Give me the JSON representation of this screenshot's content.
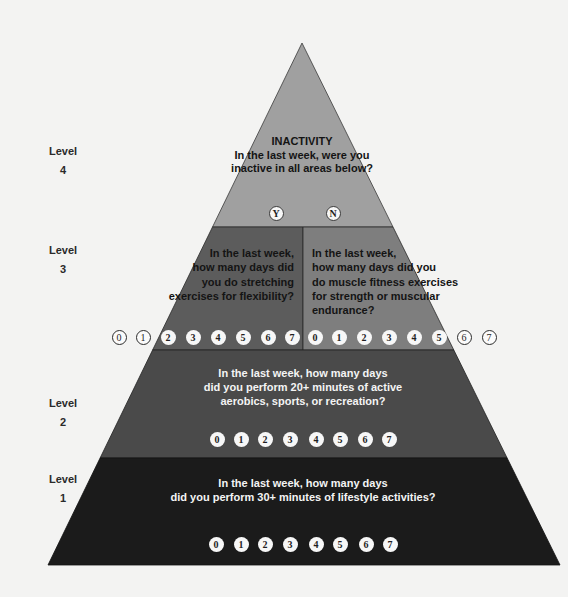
{
  "colors": {
    "background": "#f3f3f2",
    "level4": "#a0a0a0",
    "level3_left": "#5c5c5c",
    "level3_right": "#7e7e7e",
    "level2": "#4a4a4a",
    "level1": "#1b1b1b"
  },
  "level_labels": [
    {
      "label": "Level",
      "number": "4"
    },
    {
      "label": "Level",
      "number": "3"
    },
    {
      "label": "Level",
      "number": "2"
    },
    {
      "label": "Level",
      "number": "1"
    }
  ],
  "level4": {
    "title": "INACTIVITY",
    "lines": [
      "In the last week, were you",
      "inactive in all areas below?"
    ],
    "options": [
      "Y",
      "N"
    ]
  },
  "level3": {
    "left": {
      "lines": [
        "In the last week,",
        "how many days did",
        "you do stretching",
        "exercises for flexibility?"
      ],
      "options": [
        "0",
        "1",
        "2",
        "3",
        "4",
        "5",
        "6",
        "7"
      ]
    },
    "right": {
      "lines": [
        "In the last week,",
        "how many days did you",
        "do muscle fitness exercises",
        "for strength or muscular",
        "endurance?"
      ],
      "options": [
        "0",
        "1",
        "2",
        "3",
        "4",
        "5",
        "6",
        "7"
      ]
    }
  },
  "level2": {
    "lines": [
      "In the last week, how many days",
      "did you perform 20+ minutes of active",
      "aerobics, sports, or recreation?"
    ],
    "options": [
      "0",
      "1",
      "2",
      "3",
      "4",
      "5",
      "6",
      "7"
    ]
  },
  "level1": {
    "lines": [
      "In the last week, how many days",
      "did you perform 30+ minutes of lifestyle activities?"
    ],
    "options": [
      "0",
      "1",
      "2",
      "3",
      "4",
      "5",
      "6",
      "7"
    ]
  }
}
